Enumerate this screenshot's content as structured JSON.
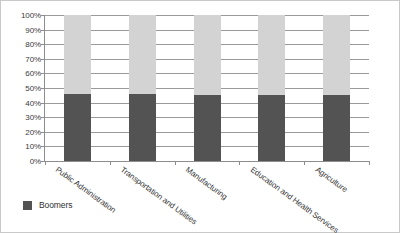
{
  "chart_data": {
    "type": "bar",
    "stacked": true,
    "normalized_percent": true,
    "title": "",
    "subtitle": "",
    "xlabel": "",
    "ylabel": "",
    "ylim": [
      0,
      100
    ],
    "ytick_labels": [
      "100%",
      "90%",
      "80%",
      "70%",
      "60%",
      "50%",
      "40%",
      "30%",
      "20%",
      "10%",
      "0%"
    ],
    "ytick_values": [
      100,
      90,
      80,
      70,
      60,
      50,
      40,
      30,
      20,
      10,
      0
    ],
    "grid": true,
    "grid_axis": "y",
    "legend_position": "bottom-left",
    "categories": [
      "Public Administration",
      "Transportation and Utilities",
      "Manufacturing",
      "Education and Health Services",
      "Agriculture"
    ],
    "series": [
      {
        "name": "Boomers",
        "color": "#535353",
        "values": [
          46,
          46,
          45,
          45,
          45
        ]
      },
      {
        "name": "",
        "color": "#d3d3d3",
        "values": [
          54,
          54,
          55,
          55,
          55
        ]
      }
    ],
    "legend_entries": [
      {
        "label": "Boomers",
        "color": "#535353"
      }
    ]
  },
  "colors": {
    "boomers": "#535353",
    "remainder": "#d3d3d3",
    "gridline": "#9a9a9a",
    "axis": "#8d8d8d",
    "border": "#c9c9c9",
    "text": "#343434",
    "background": "#ffffff"
  }
}
